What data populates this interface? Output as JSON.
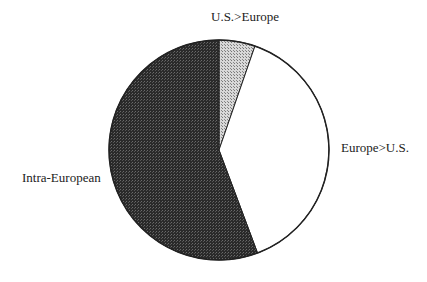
{
  "chart_data": {
    "type": "pie",
    "title": "",
    "start_angle_deg": 0,
    "direction": "clockwise",
    "slices": [
      {
        "label": "U.S.>Europe",
        "value": 5.3,
        "fill": "#bbbbbb",
        "pattern": "light-dots"
      },
      {
        "label": "Europe>U.S.",
        "value": 39.0,
        "fill": "#ffffff",
        "pattern": "none"
      },
      {
        "label": "Intra-European",
        "value": 55.7,
        "fill": "#333333",
        "pattern": "dark-dots"
      }
    ],
    "legend": "none",
    "labels_outside": true
  },
  "labels": {
    "us_europe": "U.S.>Europe",
    "europe_us": "Europe>U.S.",
    "intra": "Intra-European"
  }
}
